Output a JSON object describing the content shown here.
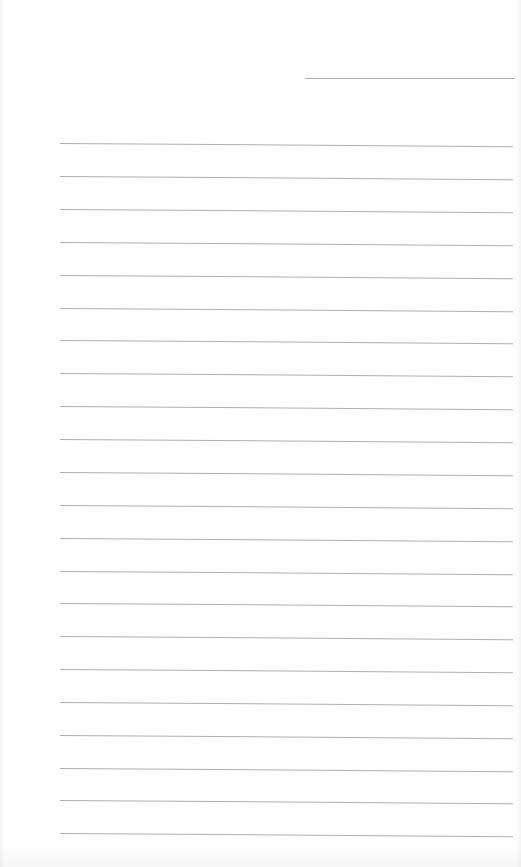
{
  "document": {
    "type": "lined-paper",
    "background_color": "#fefefe",
    "line_color": "#b0b0b0",
    "header_line": {
      "x": 305,
      "y": 78,
      "width": 210
    },
    "ruled_lines": {
      "count": 22,
      "x": 60,
      "width": 453,
      "y_positions": [
        143,
        176,
        209,
        242,
        275,
        308,
        340,
        373,
        406,
        439,
        472,
        505,
        538,
        571,
        603,
        636,
        669,
        702,
        735,
        768,
        800,
        833
      ]
    }
  }
}
